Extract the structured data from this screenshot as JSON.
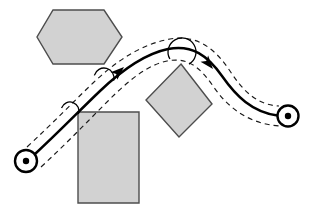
{
  "figure": {
    "width": 313,
    "height": 214,
    "background_color": "#ffffff"
  },
  "colors": {
    "obstacle_fill": "#d2d2d2",
    "obstacle_stroke": "#4d4d4d",
    "path_stroke": "#000000",
    "corridor_stroke": "#1a1a1a",
    "node_fill": "#ffffff",
    "node_stroke": "#000000"
  },
  "nodes": [
    {
      "id": "start",
      "label": "start configuration",
      "cx": 26,
      "cy": 161,
      "outer_radius": 11,
      "dot_radius": 3.2
    },
    {
      "id": "goal",
      "label": "goal configuration",
      "cx": 288,
      "cy": 116,
      "outer_radius": 10.5,
      "dot_radius": 3.2
    }
  ],
  "trajectory": {
    "label": "planned trajectory",
    "stroke_width": 2.5,
    "path": "M 34.5 154.5 C 60 131 78 112 100 91 C 122 70 144 54 168 49 C 192 44 208 56 222 76 C 236 96 252 112 277.5 115.5"
  },
  "corridor": {
    "label": "clearance corridor boundaries",
    "dash_pattern": "5 4",
    "offset": 9.5,
    "upper_path": "M 27 147 C 53 123 71 104 93 83 C 116 61 142 44 170 39 C 198 34 216 50 230 71 C 243 91 257 105 279 106",
    "lower_path": "M 41 167 C 67 143 86 123 108 101 C 130 79 148 65 167 61 C 187 57 199 66 213 86 C 228 108 249 124 280 126"
  },
  "clearance_arcs": [
    {
      "id": "arc-1",
      "label": "clearance circle 1",
      "cx": 70,
      "cy": 111,
      "r": 9,
      "start_deg": 200,
      "end_deg": 20
    },
    {
      "id": "arc-2",
      "label": "clearance circle 2",
      "cx": 104,
      "cy": 78,
      "r": 10,
      "start_deg": 195,
      "end_deg": 15
    },
    {
      "id": "arc-3",
      "label": "clearance circle 3",
      "cx": 182,
      "cy": 52,
      "r": 14,
      "start_deg": 150,
      "end_deg": 60
    }
  ],
  "direction_markers": [
    {
      "id": "arrow-1",
      "label": "direction of travel 1",
      "x": 124,
      "y": 67,
      "angle_deg": -42,
      "size": 9
    },
    {
      "id": "arrow-2",
      "label": "direction of travel 2",
      "x": 213,
      "y": 69,
      "angle_deg": 50,
      "size": 9
    }
  ],
  "obstacles": [
    {
      "id": "hexagon",
      "label": "hexagonal obstacle",
      "shape": "hexagon",
      "points": "53,10 104,10 122,37 104,64 53,64 37,37"
    },
    {
      "id": "rectangle",
      "label": "rectangular obstacle",
      "shape": "rectangle",
      "points": "78,112 139,112 139,203 78,203"
    },
    {
      "id": "diamond",
      "label": "diamond obstacle",
      "shape": "diamond",
      "points": "181,64 212,104 179,137 146,100"
    }
  ]
}
